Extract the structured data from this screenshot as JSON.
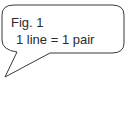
{
  "callout": {
    "title": "Fig. 1",
    "caption": "1 line = 1 pair",
    "stroke_color": "#3a3a3a",
    "fill_color": "#ffffff",
    "text_color": "#2b2b2b"
  }
}
